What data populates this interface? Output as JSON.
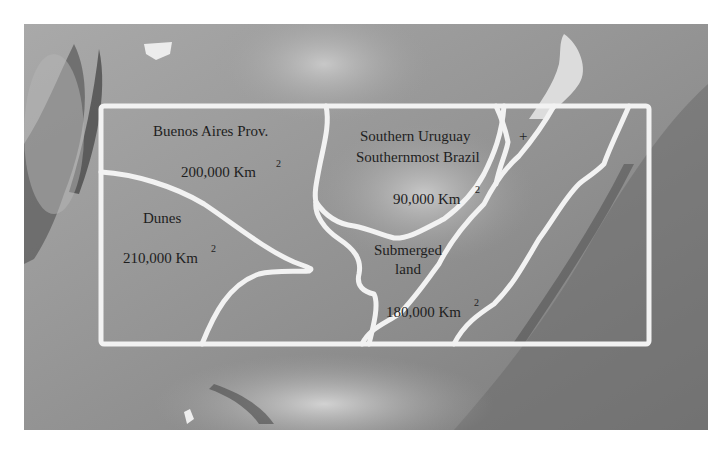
{
  "map": {
    "type": "shaded-relief grayscale map",
    "box_color": "#f2f2f2",
    "regions": [
      {
        "id": "buenos-aires",
        "name": "Buenos Aires Prov.",
        "area": "200,000 Km",
        "superscript": "2"
      },
      {
        "id": "uruguay-brazil",
        "name_line1": "Southern Uruguay",
        "plus": "+",
        "name_line2": "Southernmost Brazil",
        "area": "90,000 Km",
        "superscript": "2"
      },
      {
        "id": "dunes",
        "name": "Dunes",
        "area": "210,000 Km",
        "superscript": "2"
      },
      {
        "id": "submerged",
        "name_line1": "Submerged",
        "name_line2": "land",
        "area": "180,000 Km",
        "superscript": "2"
      }
    ]
  }
}
